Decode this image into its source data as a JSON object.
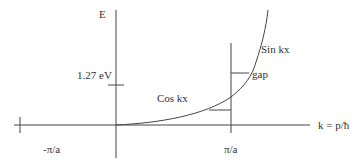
{
  "diagram": {
    "title": "",
    "axes": {
      "vertical_label": "E",
      "horizontal_label": "k = p/ħ"
    },
    "ticks": {
      "energy_tick": "1.27 eV",
      "neg_zone_boundary": "-π/a",
      "pos_zone_boundary": "π/a"
    },
    "curve_labels": {
      "lower_branch": "Cos kx",
      "upper_branch": "Sin kx",
      "gap": "gap"
    },
    "colors": {
      "line": "#333333",
      "background": "#ffffff"
    }
  }
}
